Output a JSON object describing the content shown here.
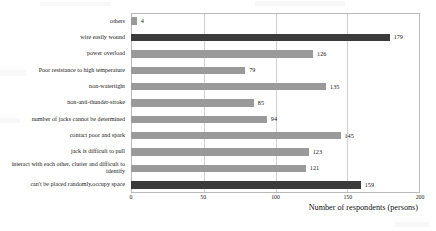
{
  "chart_data": {
    "type": "bar",
    "orientation": "horizontal",
    "title": "",
    "xlabel": "Number of respondents (persons)",
    "ylabel": "",
    "xlim": [
      0,
      200
    ],
    "xticks": [
      0,
      50,
      100,
      150,
      200
    ],
    "grid": true,
    "legend": "none",
    "categories": [
      "others",
      "wire easily wound",
      "power overload",
      "Poor resistance to high temperature",
      "non-watertight",
      "non-anti-thunder-stroke",
      "number of jacks cannot be determined",
      "contact poor and spark",
      "jack is difficult to pull",
      "interact with each other, clutter and difficult to identify",
      "can't be placed randomly,occupy space"
    ],
    "values": [
      4,
      179,
      126,
      79,
      135,
      85,
      94,
      145,
      123,
      121,
      159
    ],
    "bar_colors": [
      "#9a9a9a",
      "#3b3b3b",
      "#9a9a9a",
      "#9a9a9a",
      "#9a9a9a",
      "#9a9a9a",
      "#9a9a9a",
      "#9a9a9a",
      "#9a9a9a",
      "#9a9a9a",
      "#3b3b3b"
    ],
    "value_labels": [
      "4",
      "179",
      "126",
      "79",
      "135",
      "85",
      "94",
      "145",
      "123",
      "121",
      "159"
    ],
    "colors": {
      "bar_default": "#9a9a9a",
      "bar_highlight": "#3b3b3b",
      "gridline": "#d2d2d2",
      "frame": "#b9b9b9",
      "text": "#1a1a1a",
      "background": "#ffffff"
    }
  }
}
